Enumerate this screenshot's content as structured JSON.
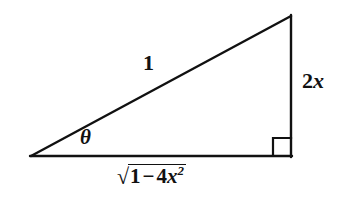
{
  "figure": {
    "kind": "right-triangle-diagram",
    "background_color": "#ffffff",
    "stroke_color": "#111111",
    "stroke_width": 2,
    "width": 342,
    "height": 211
  },
  "triangle": {
    "vertices": {
      "left": [
        31,
        156
      ],
      "apex": [
        291,
        16
      ],
      "right": [
        291,
        156
      ]
    },
    "right_angle_marker": {
      "at": "right",
      "size": 18,
      "shown": true
    }
  },
  "labels": {
    "hypotenuse": "1",
    "opposite_leg": {
      "coefficient": "2",
      "variable": "x",
      "full": "2x"
    },
    "angle": "θ",
    "adjacent_leg": {
      "radical_sign": "√",
      "first_term": "1",
      "operator": "−",
      "coefficient": "4",
      "variable": "x",
      "exponent": "2",
      "full": "√(1 − 4x²)"
    }
  }
}
